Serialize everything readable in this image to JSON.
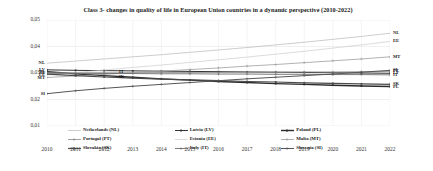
{
  "chart_data": {
    "type": "line",
    "title": "Class 3- changes in quality of life in European Union countries in a dynamic perspective (2010-2022)",
    "xlabel": "",
    "ylabel": "",
    "grid": true,
    "legend_position": "bottom",
    "ylim": [
      0.01,
      0.05
    ],
    "yticks": [
      0.05,
      0.04,
      0.03,
      0.02,
      0.01
    ],
    "ytick_labels": [
      "0,05",
      "0,04",
      "0,03",
      "0,02",
      "0,01"
    ],
    "x": [
      2010,
      2011,
      2012,
      2013,
      2014,
      2015,
      2016,
      2017,
      2018,
      2019,
      2020,
      2021,
      2022
    ],
    "xtick_labels": [
      "2010",
      "2011",
      "2012",
      "2013",
      "2014",
      "2015",
      "2016",
      "2017",
      "2018",
      "2019",
      "2020",
      "2021",
      "2022"
    ],
    "series": [
      {
        "name": "Netherlands (NL)",
        "code": "NL",
        "color": "#b7b7b7",
        "marker": "none",
        "width": 0.7,
        "values": [
          0.0337,
          0.0345,
          0.0353,
          0.0361,
          0.0369,
          0.0378,
          0.0387,
          0.0396,
          0.0406,
          0.0416,
          0.0427,
          0.0438,
          0.045
        ]
      },
      {
        "name": "Latvia (LV)",
        "code": "LV",
        "color": "#333333",
        "marker": "square",
        "width": 1.0,
        "values": [
          0.0312,
          0.031,
          0.0309,
          0.0308,
          0.0307,
          0.0306,
          0.0305,
          0.0304,
          0.0303,
          0.0302,
          0.0301,
          0.03,
          0.0299
        ]
      },
      {
        "name": "Poland (PL)",
        "code": "PL",
        "color": "#2b2b2b",
        "marker": "square",
        "width": 1.4,
        "values": [
          0.0305,
          0.0297,
          0.029,
          0.0284,
          0.0278,
          0.0273,
          0.0268,
          0.0264,
          0.026,
          0.0257,
          0.0254,
          0.0251,
          0.0249
        ]
      },
      {
        "name": "Portugal (PT)",
        "code": "PT",
        "color": "#8a8a8a",
        "marker": "plus",
        "width": 0.8,
        "values": [
          0.0301,
          0.0301,
          0.0301,
          0.0301,
          0.0302,
          0.0302,
          0.0302,
          0.0303,
          0.0303,
          0.0304,
          0.0304,
          0.0305,
          0.0306
        ]
      },
      {
        "name": "Estonia (EE)",
        "code": "EE",
        "color": "#cccccc",
        "marker": "none",
        "width": 0.7,
        "values": [
          0.0292,
          0.0302,
          0.0311,
          0.0321,
          0.033,
          0.034,
          0.035,
          0.036,
          0.0371,
          0.0382,
          0.0394,
          0.0406,
          0.0419
        ]
      },
      {
        "name": "Malta (MT)",
        "code": "MT",
        "color": "#9e9e9e",
        "marker": "plus",
        "width": 0.8,
        "values": [
          0.0283,
          0.0289,
          0.0295,
          0.0301,
          0.0307,
          0.0313,
          0.0319,
          0.0326,
          0.0332,
          0.0339,
          0.0346,
          0.0353,
          0.0361
        ]
      },
      {
        "name": "Slovakia (SK)",
        "code": "SK",
        "color": "#4a4a4a",
        "marker": "square",
        "width": 1.2,
        "values": [
          0.0296,
          0.029,
          0.0285,
          0.0281,
          0.0277,
          0.0274,
          0.0271,
          0.0268,
          0.0266,
          0.0263,
          0.0261,
          0.0259,
          0.0257
        ]
      },
      {
        "name": "Italy (IT)",
        "code": "IT",
        "color": "#6e6e6e",
        "marker": "plus",
        "width": 0.9,
        "values": [
          0.0299,
          0.0299,
          0.0298,
          0.0298,
          0.0297,
          0.0297,
          0.0296,
          0.0296,
          0.0295,
          0.0295,
          0.0294,
          0.0294,
          0.0293
        ]
      },
      {
        "name": "Slovenia (SI)",
        "code": "SI",
        "color": "#555555",
        "marker": "plus",
        "width": 1.0,
        "values": [
          0.0222,
          0.0233,
          0.0242,
          0.025,
          0.0257,
          0.0264,
          0.0271,
          0.0278,
          0.0284,
          0.029,
          0.0296,
          0.0303,
          0.031
        ]
      }
    ],
    "left_labels": [
      {
        "code": "NL",
        "value": 0.0337
      },
      {
        "code": "LV",
        "value": 0.0312
      },
      {
        "code": "PL",
        "value": 0.0305
      },
      {
        "code": "IT",
        "value": 0.0299
      },
      {
        "code": "EE",
        "value": 0.0292
      },
      {
        "code": "MT",
        "value": 0.0283
      },
      {
        "code": "SI",
        "value": 0.0222
      }
    ],
    "right_labels": [
      {
        "code": "NL",
        "value": 0.045
      },
      {
        "code": "EE",
        "value": 0.0419
      },
      {
        "code": "MT",
        "value": 0.0361
      },
      {
        "code": "SI",
        "value": 0.031
      },
      {
        "code": "PT",
        "value": 0.0306
      },
      {
        "code": "LV",
        "value": 0.0299
      },
      {
        "code": "IT",
        "value": 0.0293
      },
      {
        "code": "SK",
        "value": 0.0257
      },
      {
        "code": "PL",
        "value": 0.0249
      }
    ],
    "inline_labels": [
      {
        "code": "IT",
        "x": 2012.6,
        "value": 0.0303
      },
      {
        "code": "SK",
        "x": 2012.6,
        "value": 0.0285
      }
    ]
  },
  "legend": {
    "items": [
      {
        "label": "Netherlands (NL)",
        "code": "NL"
      },
      {
        "label": "Latvia (LV)",
        "code": "LV"
      },
      {
        "label": "Poland (PL)",
        "code": "PL"
      },
      {
        "label": "Portugal (PT)",
        "code": "PT"
      },
      {
        "label": "Estonia (EE)",
        "code": "EE"
      },
      {
        "label": "Malta (MT)",
        "code": "MT"
      },
      {
        "label": "Slovakia (SK)",
        "code": "SK"
      },
      {
        "label": "Italy (IT)",
        "code": "IT"
      },
      {
        "label": "Slovenia (SI)",
        "code": "SI"
      }
    ]
  }
}
